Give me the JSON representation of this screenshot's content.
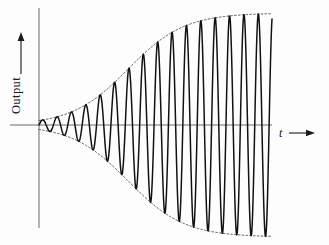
{
  "figure": {
    "title": "",
    "background_color": "#fdfdfd",
    "curve_color": "#111111",
    "envelope_color": "#4a4a4a",
    "axis_color": "#5a5a5a"
  },
  "axes": {
    "y": {
      "label": "Output",
      "arrow_icon": "up-arrow-icon",
      "line": {
        "x": 39,
        "y_top": 8,
        "y_bottom": 228
      }
    },
    "x": {
      "label": "t",
      "arrow_icon": "right-arrow-icon",
      "line": {
        "y": 125,
        "x_left": 10,
        "x_right": 272
      }
    }
  },
  "chart_data": {
    "type": "line",
    "title": "",
    "xlabel": "t",
    "ylabel": "Output",
    "xlim": [
      0,
      16.2
    ],
    "ylim": [
      -1.15,
      1.15
    ],
    "grid": false,
    "legend": null,
    "annotations": [
      {
        "text": "Output",
        "role": "y-axis-label",
        "arrow": "up"
      },
      {
        "text": "t",
        "role": "x-axis-label",
        "arrow": "right"
      }
    ],
    "envelope": {
      "style": "dotted",
      "symmetric": true,
      "model": "A(t) = 1 / (1 + exp(-(t - 6.2) / 1.95))",
      "points": [
        {
          "t": 0.0,
          "amplitude": 0.04
        },
        {
          "t": 1.0,
          "amplitude": 0.07
        },
        {
          "t": 2.0,
          "amplitude": 0.11
        },
        {
          "t": 3.0,
          "amplitude": 0.17
        },
        {
          "t": 4.0,
          "amplitude": 0.25
        },
        {
          "t": 5.0,
          "amplitude": 0.36
        },
        {
          "t": 6.0,
          "amplitude": 0.48
        },
        {
          "t": 7.0,
          "amplitude": 0.6
        },
        {
          "t": 8.0,
          "amplitude": 0.71
        },
        {
          "t": 9.0,
          "amplitude": 0.8
        },
        {
          "t": 10.0,
          "amplitude": 0.87
        },
        {
          "t": 11.0,
          "amplitude": 0.92
        },
        {
          "t": 12.0,
          "amplitude": 0.95
        },
        {
          "t": 13.0,
          "amplitude": 0.97
        },
        {
          "t": 14.0,
          "amplitude": 0.98
        },
        {
          "t": 15.0,
          "amplitude": 0.99
        },
        {
          "t": 16.0,
          "amplitude": 0.99
        }
      ]
    },
    "series": [
      {
        "name": "output",
        "style": "solid",
        "model": "y(t) = A(t) * sin(2*pi*t)",
        "cycles": 16,
        "period": 1.0,
        "t_start": 0.0,
        "t_end": 16.2
      }
    ]
  }
}
